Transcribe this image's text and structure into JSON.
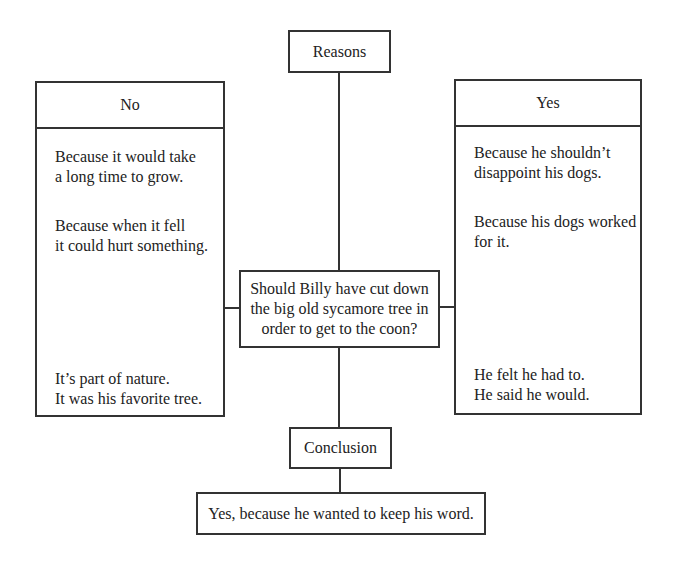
{
  "diagram": {
    "reasons_label": "Reasons",
    "question": "Should Billy have cut down the big old sycamore tree in order to get to the coon?",
    "question_lines": [
      "Should Billy have cut down",
      "the big old sycamore tree in",
      "order to get to the coon?"
    ],
    "no_column": {
      "heading": "No",
      "items": [
        "Because it would take\na long time to grow.",
        "Because when it fell\nit could hurt something.",
        "It’s part of nature.\nIt was his favorite tree."
      ]
    },
    "yes_column": {
      "heading": "Yes",
      "items": [
        "Because he shouldn’t\ndisappoint his dogs.",
        "Because his dogs worked\nfor it.",
        "He felt he had to.\nHe said he would."
      ]
    },
    "conclusion_label": "Conclusion",
    "conclusion": "Yes, because he wanted to keep his word."
  },
  "colors": {
    "stroke": "#333333",
    "background": "#ffffff",
    "text": "#222222"
  }
}
